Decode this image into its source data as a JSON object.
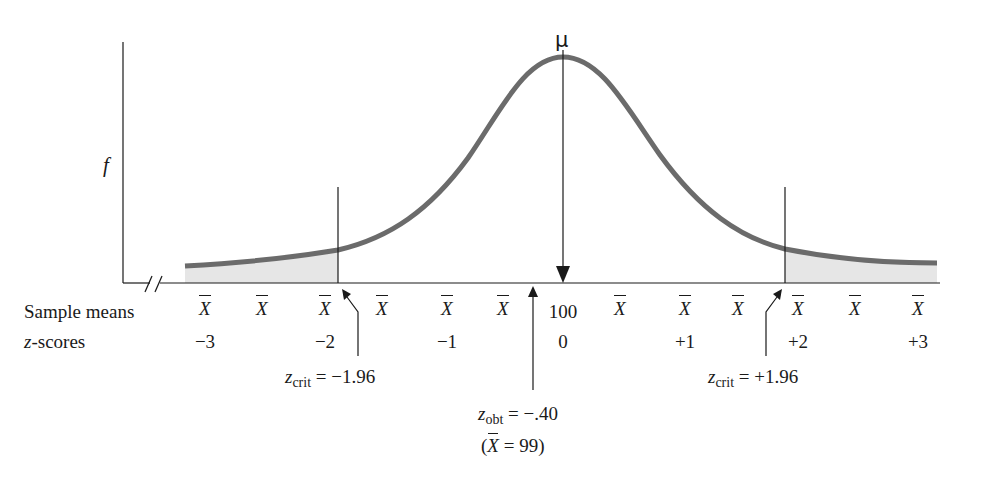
{
  "figure": {
    "y_axis_label": "f",
    "mean_label": "μ",
    "row_labels": {
      "sample_means": "Sample means",
      "z_scores_italic": "z",
      "z_scores_rest": "-scores"
    },
    "sample_means": [
      {
        "x": 205,
        "text": "X",
        "bar": true
      },
      {
        "x": 262,
        "text": "X",
        "bar": true
      },
      {
        "x": 325,
        "text": "X",
        "bar": true
      },
      {
        "x": 382,
        "text": "X",
        "bar": true
      },
      {
        "x": 447,
        "text": "X",
        "bar": true
      },
      {
        "x": 503,
        "text": "X",
        "bar": true
      },
      {
        "x": 563,
        "text": "100",
        "bar": false
      },
      {
        "x": 620,
        "text": "X",
        "bar": true
      },
      {
        "x": 685,
        "text": "X",
        "bar": true
      },
      {
        "x": 738,
        "text": "X",
        "bar": true
      },
      {
        "x": 798,
        "text": "X",
        "bar": true
      },
      {
        "x": 855,
        "text": "X",
        "bar": true
      },
      {
        "x": 918,
        "text": "X",
        "bar": true
      }
    ],
    "z_scores": [
      {
        "x": 205,
        "text": "−3"
      },
      {
        "x": 325,
        "text": "−2"
      },
      {
        "x": 447,
        "text": "−1"
      },
      {
        "x": 563,
        "text": "0"
      },
      {
        "x": 685,
        "text": "+1"
      },
      {
        "x": 798,
        "text": "+2"
      },
      {
        "x": 918,
        "text": "+3"
      }
    ],
    "annotations": {
      "z_crit_left": {
        "var": "z",
        "sub": "crit",
        "value": " = −1.96"
      },
      "z_crit_right": {
        "var": "z",
        "sub": "crit",
        "value": " = +1.96"
      },
      "z_obt": {
        "var": "z",
        "sub": "obt",
        "value": " = −.40"
      },
      "z_obt_sample": {
        "open": "(",
        "var": "X",
        "value": " = 99)"
      }
    },
    "colors": {
      "curve": "#6b6b6b",
      "shade": "#e6e6e6",
      "ink": "#1a1a1a"
    }
  },
  "chart_data": {
    "type": "area",
    "xlabel": "Sample means / z-scores",
    "ylabel": "f",
    "mean": 100,
    "x": [
      -3,
      -2,
      -1,
      0,
      1,
      2,
      3
    ],
    "z_tick_labels": [
      "−3",
      "−2",
      "−1",
      "0",
      "+1",
      "+2",
      "+3"
    ],
    "sample_mean_center_label": "100",
    "critical_values": [
      -1.96,
      1.96
    ],
    "rejection_regions_shaded": [
      "z < −1.96",
      "z > +1.96"
    ],
    "z_obtained": -0.4,
    "sample_mean_obtained": 99,
    "grid": false
  }
}
